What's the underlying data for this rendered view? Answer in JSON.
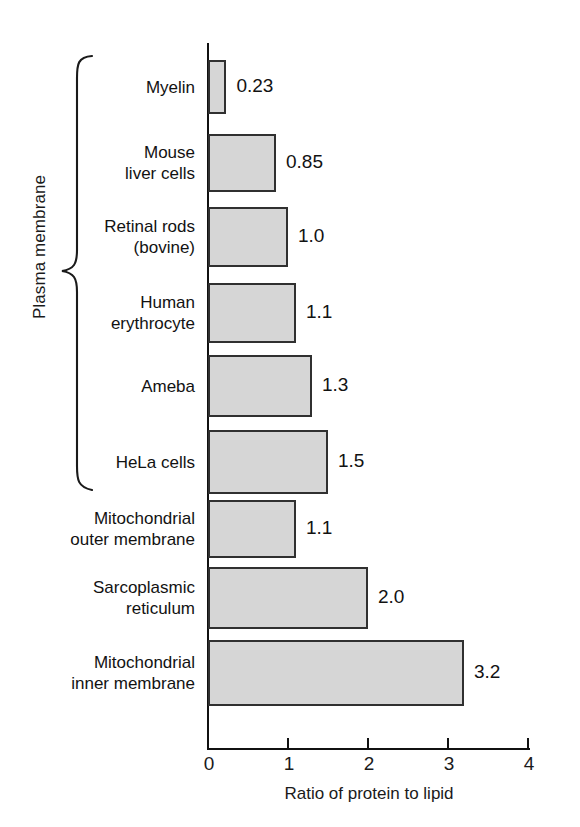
{
  "chart_data": {
    "type": "bar",
    "orientation": "horizontal",
    "title": "",
    "xlabel": "Ratio of protein to lipid",
    "ylabel": "",
    "xlim": [
      0,
      4
    ],
    "xticks": [
      "0",
      "1",
      "2",
      "3",
      "4"
    ],
    "grid": false,
    "legend": null,
    "categories": [
      "Myelin",
      "Mouse liver cells",
      "Retinal rods (bovine)",
      "Human erythrocyte",
      "Ameba",
      "HeLa cells",
      "Mitochondrial outer membrane",
      "Sarcoplasmic reticulum",
      "Mitochondrial inner membrane"
    ],
    "values": [
      0.23,
      0.85,
      1.0,
      1.1,
      1.3,
      1.5,
      1.1,
      2.0,
      3.2
    ],
    "value_labels": [
      "0.23",
      "0.85",
      "1.0",
      "1.1",
      "1.3",
      "1.5",
      "1.1",
      "2.0",
      "3.2"
    ],
    "annotations": [
      {
        "name": "plasma-membrane-group",
        "text": "Plasma membrane",
        "covers": [
          "Myelin",
          "Mouse liver cells",
          "Retinal rods (bovine)",
          "Human erythrocyte",
          "Ameba",
          "HeLa cells"
        ]
      }
    ],
    "colors": {
      "bar_fill": "#d6d6d6",
      "bar_stroke": "#303030",
      "axis": "#111111",
      "text": "#121212",
      "background": "#ffffff"
    }
  },
  "rows": [
    {
      "label_line1": "Myelin",
      "label_line2": "",
      "value": "0.23"
    },
    {
      "label_line1": "Mouse",
      "label_line2": "liver cells",
      "value": "0.85"
    },
    {
      "label_line1": "Retinal rods",
      "label_line2": "(bovine)",
      "value": "1.0"
    },
    {
      "label_line1": "Human",
      "label_line2": "erythrocyte",
      "value": "1.1"
    },
    {
      "label_line1": "Ameba",
      "label_line2": "",
      "value": "1.3"
    },
    {
      "label_line1": "HeLa cells",
      "label_line2": "",
      "value": "1.5"
    },
    {
      "label_line1": "Mitochondrial",
      "label_line2": "outer membrane",
      "value": "1.1"
    },
    {
      "label_line1": "Sarcoplasmic",
      "label_line2": "reticulum",
      "value": "2.0"
    },
    {
      "label_line1": "Mitochondrial",
      "label_line2": "inner membrane",
      "value": "3.2"
    }
  ],
  "axis": {
    "title": "Ratio of protein to lipid",
    "ticks": [
      "0",
      "1",
      "2",
      "3",
      "4"
    ]
  },
  "group": {
    "caption": "Plasma membrane"
  }
}
